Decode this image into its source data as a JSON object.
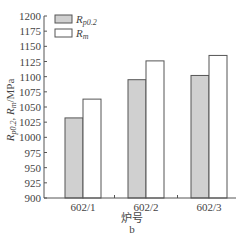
{
  "chart_data": {
    "type": "bar",
    "title": "",
    "panel_label": "b",
    "xlabel": "炉号",
    "ylabel": "R_p0.2, R_m/MPa",
    "ylabel_display": {
      "part1": "R",
      "sub1": "p0.2",
      "sep": ", ",
      "part2": "R",
      "sub2": "m",
      "unit": "/MPa"
    },
    "ylim": [
      900,
      1200
    ],
    "yticks": [
      900,
      925,
      950,
      975,
      1000,
      1025,
      1050,
      1075,
      1100,
      1125,
      1150,
      1175,
      1200
    ],
    "grid": false,
    "legend_position": "upper-left",
    "categories": [
      "602/1",
      "602/2",
      "602/3"
    ],
    "series": [
      {
        "name": "R_p0.2",
        "label_main": "R",
        "label_sub": "p0.2",
        "color": "#d0d0d0",
        "values": [
          1032,
          1095,
          1102
        ]
      },
      {
        "name": "R_m",
        "label_main": "R",
        "label_sub": "m",
        "color": "#ffffff",
        "values": [
          1063,
          1126,
          1135
        ]
      }
    ]
  }
}
